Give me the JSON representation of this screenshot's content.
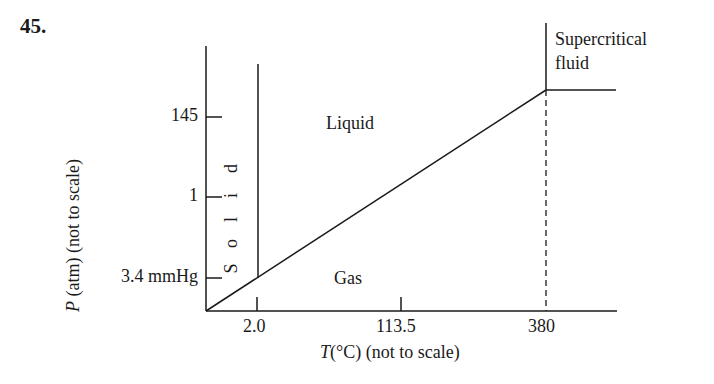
{
  "problem_number": "45.",
  "diagram": {
    "type": "phase_diagram",
    "x_axis": {
      "label_var": "T",
      "label_rest": "(°C) (not to scale)",
      "ticks": [
        "2.0",
        "113.5",
        "380"
      ]
    },
    "y_axis": {
      "label_var": "P",
      "label_rest": " (atm) (not to scale)",
      "ticks": [
        "145",
        "1",
        "3.4 mmHg"
      ]
    },
    "regions": {
      "solid": [
        "S",
        "o",
        "l",
        "i",
        "d"
      ],
      "liquid": "Liquid",
      "gas": "Gas",
      "supercritical_line1": "Supercritical",
      "supercritical_line2": "fluid"
    },
    "points": {
      "triple_point": {
        "T": "2.0",
        "P": "3.4 mmHg"
      },
      "critical_point": {
        "T": "380",
        "P": "145"
      }
    },
    "line_color": "#1a1a1a"
  }
}
